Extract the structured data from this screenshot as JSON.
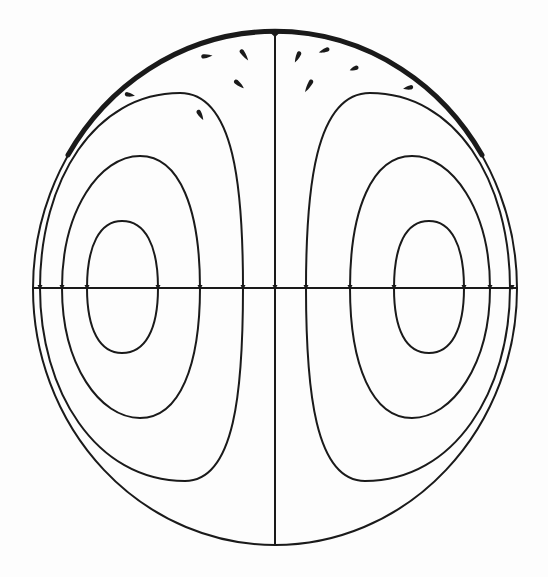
{
  "figure": {
    "colors": {
      "ink": "#1a1a1a",
      "background": "#fdfdfd"
    },
    "boundary": {
      "cx": 275,
      "cy": 288.5,
      "rx": 242,
      "ry": 256.5,
      "stroke_width": 2
    },
    "boundary_thick_arc": {
      "d": "M 68 155 A 242 256.5 0 0 1 482 155",
      "stroke_width": 5
    },
    "axes": {
      "horizontal": {
        "x1": 33,
        "y1": 288,
        "x2": 517,
        "y2": 288,
        "stroke_width": 2
      },
      "vertical": {
        "x1": 275,
        "y1": 32,
        "x2": 275,
        "y2": 545,
        "stroke_width": 2
      }
    },
    "streamlines": [
      {
        "name": "left-outer-loop",
        "d": "M 40 288 C 40 180 95 93 180 93 C 235 93 243 190 243 288 C 243 390 235 481 185 481 C 95 481 40 390 40 288 Z"
      },
      {
        "name": "left-middle-loop",
        "d": "M 62 288 C 62 210 100 156 140 156 C 180 156 200 210 200 288 C 200 365 180 418 140 418 C 100 418 62 365 62 288 Z"
      },
      {
        "name": "left-inner-loop",
        "d": "M 87 288 C 87 245 100 221 122 221 C 145 221 158 245 158 288 C 158 330 145 353 122 353 C 100 353 87 330 87 288 Z"
      },
      {
        "name": "right-outer-loop",
        "d": "M 510 288 C 510 180 455 93 370 93 C 315 93 306 190 306 288 C 306 390 315 481 365 481 C 455 481 510 390 510 288 Z"
      },
      {
        "name": "right-middle-loop",
        "d": "M 490 288 C 490 210 452 156 412 156 C 372 156 350 210 350 288 C 350 365 372 418 412 418 C 452 418 490 365 490 288 Z"
      },
      {
        "name": "right-inner-loop",
        "d": "M 464 288 C 464 245 451 221 429 221 C 406 221 394 245 394 288 C 394 330 406 353 429 353 C 451 353 464 330 464 288 Z"
      }
    ],
    "axis_ticks": [
      40,
      62,
      87,
      158,
      200,
      243,
      275,
      306,
      350,
      394,
      464,
      490,
      512
    ],
    "droplets": [
      {
        "name": "droplet-1",
        "x": 131,
        "y": 95,
        "angle": 10,
        "len": 8
      },
      {
        "name": "droplet-2",
        "x": 208,
        "y": 56,
        "angle": -5,
        "len": 9
      },
      {
        "name": "droplet-3",
        "x": 245,
        "y": 56,
        "angle": 55,
        "len": 11
      },
      {
        "name": "droplet-4",
        "x": 240,
        "y": 85,
        "angle": 40,
        "len": 10
      },
      {
        "name": "droplet-5",
        "x": 201,
        "y": 116,
        "angle": 60,
        "len": 9
      },
      {
        "name": "droplet-6",
        "x": 297,
        "y": 58,
        "angle": 115,
        "len": 10
      },
      {
        "name": "droplet-7",
        "x": 323,
        "y": 51,
        "angle": 160,
        "len": 9
      },
      {
        "name": "droplet-8",
        "x": 353,
        "y": 69,
        "angle": 160,
        "len": 7
      },
      {
        "name": "droplet-9",
        "x": 308,
        "y": 87,
        "angle": 120,
        "len": 12
      },
      {
        "name": "droplet-10",
        "x": 407,
        "y": 88,
        "angle": 170,
        "len": 8
      }
    ]
  }
}
